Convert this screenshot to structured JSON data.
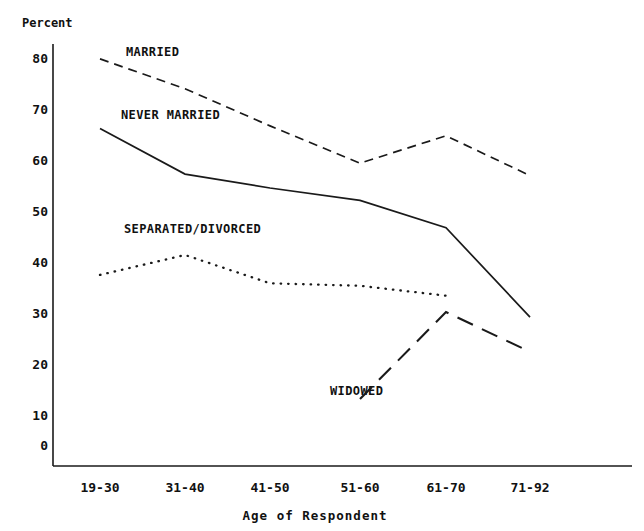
{
  "chart_data": {
    "type": "line",
    "title": "",
    "xlabel": "Age of Respondent",
    "ylabel": "Percent",
    "categories": [
      "19-30",
      "31-40",
      "41-50",
      "51-60",
      "61-70",
      "71-92"
    ],
    "ylim": [
      0,
      85
    ],
    "yticks": [
      0,
      10,
      20,
      30,
      40,
      50,
      60,
      70,
      80
    ],
    "ytick_labels": [
      "0",
      "10",
      "20",
      "30",
      "40",
      "50",
      "60",
      "70",
      "80"
    ],
    "grid": false,
    "legend_position": "inline-annotations",
    "series": [
      {
        "name": "MARRIED",
        "style": "dashed",
        "values": [
          82,
          76,
          68.5,
          61,
          66.5,
          58.5
        ],
        "label_text": "MARRIED"
      },
      {
        "name": "NEVER MARRIED",
        "style": "solid",
        "values": [
          68,
          58.8,
          56,
          53.5,
          48,
          30
        ],
        "label_text": "NEVER MARRIED"
      },
      {
        "name": "SEPARATED/DIVORCED",
        "style": "dotted",
        "values": [
          38.5,
          42.5,
          36.8,
          36.3,
          34.3,
          null
        ],
        "label_text": "SEPARATED/DIVORCED"
      },
      {
        "name": "WIDOWED",
        "style": "long-dashed",
        "values": [
          null,
          null,
          null,
          13.5,
          31,
          23
        ],
        "label_text": "WIDOWED"
      }
    ],
    "annotations": [
      {
        "text": "MARRIED",
        "x_px": 126,
        "y_px": 51
      },
      {
        "text": "NEVER MARRIED",
        "x_px": 121,
        "y_px": 114
      },
      {
        "text": "SEPARATED/DIVORCED",
        "x_px": 124,
        "y_px": 228
      },
      {
        "text": "WIDOWED",
        "x_px": 330,
        "y_px": 390
      }
    ],
    "axis_color": "#1a1a1a",
    "line_color": "#1a1a1a"
  },
  "axes": {
    "y_title": "Percent",
    "x_title": "Age of Respondent"
  }
}
